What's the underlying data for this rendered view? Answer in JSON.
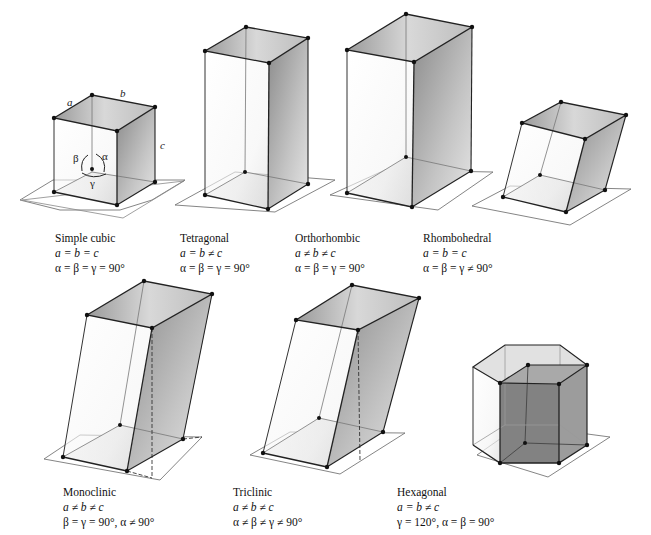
{
  "figure": {
    "systems": [
      {
        "name": "Simple cubic",
        "axes": "a = b = c",
        "angles": "α = β = γ = 90°"
      },
      {
        "name": "Tetragonal",
        "axes": "a = b ≠ c",
        "angles": "α = β = γ = 90°"
      },
      {
        "name": "Orthorhombic",
        "axes": "a ≠ b ≠ c",
        "angles": "α = β = γ = 90°"
      },
      {
        "name": "Rhombohedral",
        "axes": "a = b = c",
        "angles": "α = β = γ ≠ 90°"
      },
      {
        "name": "Monoclinic",
        "axes": "a ≠ b ≠ c",
        "angles": "β = γ = 90°, α ≠ 90°"
      },
      {
        "name": "Triclinic",
        "axes": "a ≠ b ≠ c",
        "angles": "α ≠ β ≠ γ ≠ 90°"
      },
      {
        "name": "Hexagonal",
        "axes": "a = b ≠ c",
        "angles": "γ = 120°, α = β = 90°"
      }
    ],
    "cubic_labels": {
      "a": "a",
      "b": "b",
      "c": "c",
      "alpha": "α",
      "beta": "β",
      "gamma": "γ"
    },
    "bottom_caption": "Figure — The seven crystal systems. The lengths of the edges of each unit cell ..."
  }
}
